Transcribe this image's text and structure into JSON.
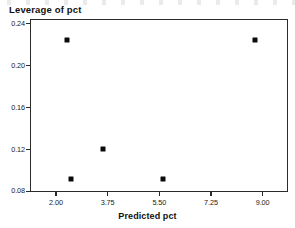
{
  "chart_data": {
    "type": "scatter",
    "title": "Leverage of pct",
    "xlabel": "Predicted pct",
    "ylabel": "",
    "xlim": [
      1.12,
      9.86
    ],
    "ylim": [
      0.0795,
      0.2445
    ],
    "grid": false,
    "legend": null,
    "marker": "filled-square",
    "marker_color": "#0a0a0a",
    "xticks": [
      "2.00",
      "3.75",
      "5.50",
      "7.25",
      "9.00"
    ],
    "xtick_values": [
      2.0,
      3.75,
      5.5,
      7.25,
      9.0
    ],
    "yticks": [
      "0.24",
      "0.20",
      "0.16",
      "0.12",
      "0.08"
    ],
    "ytick_values": [
      0.24,
      0.2,
      0.16,
      0.12,
      0.08
    ],
    "points": [
      {
        "x": 2.33,
        "y": 0.2255
      },
      {
        "x": 2.49,
        "y": 0.0932
      },
      {
        "x": 3.55,
        "y": 0.1215
      },
      {
        "x": 5.59,
        "y": 0.0932
      },
      {
        "x": 8.72,
        "y": 0.2255
      }
    ]
  }
}
